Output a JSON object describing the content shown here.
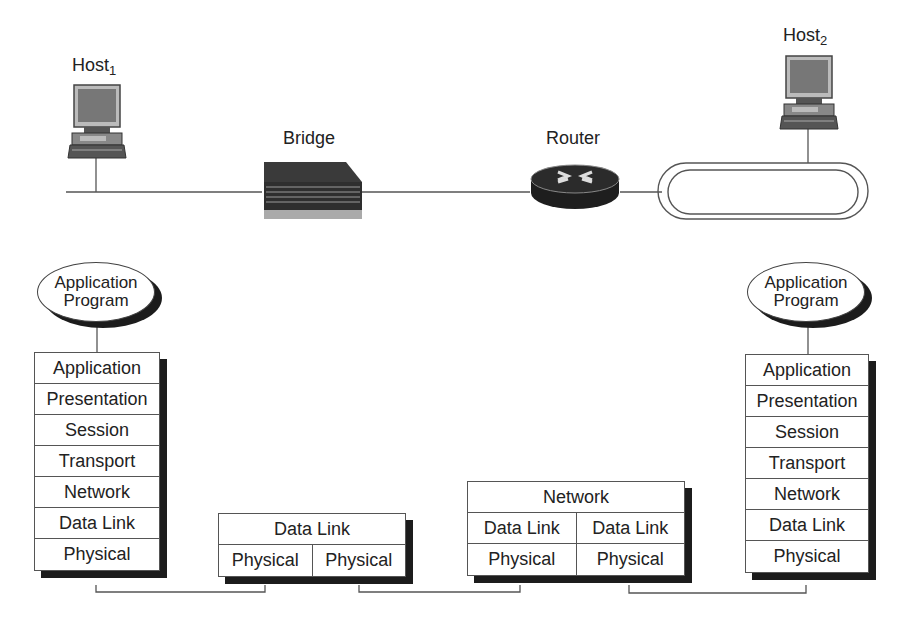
{
  "diagram": {
    "title": "",
    "devices": {
      "host1": {
        "label": "Host",
        "subscript": "1"
      },
      "host2": {
        "label": "Host",
        "subscript": "2"
      },
      "bridge": {
        "label": "Bridge"
      },
      "router": {
        "label": "Router"
      }
    },
    "left_app": {
      "line1": "Application",
      "line2": "Program"
    },
    "right_app": {
      "line1": "Application",
      "line2": "Program"
    },
    "left_stack": [
      "Application",
      "Presentation",
      "Session",
      "Transport",
      "Network",
      "Data Link",
      "Physical"
    ],
    "right_stack": [
      "Application",
      "Presentation",
      "Session",
      "Transport",
      "Network",
      "Data Link",
      "Physical"
    ],
    "bridge_stack": {
      "top": "Data Link",
      "bottom": [
        "Physical",
        "Physical"
      ]
    },
    "router_stack": {
      "top": "Network",
      "middle": [
        "Data Link",
        "Data Link"
      ],
      "bottom": [
        "Physical",
        "Physical"
      ]
    },
    "colors": {
      "line": "#555555",
      "shadow": "#1c1c1c",
      "device_dark": "#2a2a2a"
    }
  }
}
